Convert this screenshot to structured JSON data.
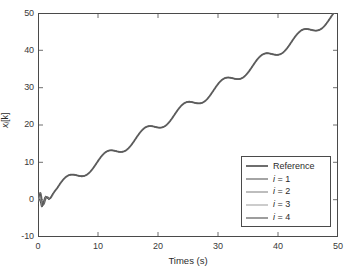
{
  "chart_data": {
    "type": "line",
    "title": "",
    "xlabel": "Times (s)",
    "ylabel": "x_i[k]",
    "ylabel_base": "x",
    "ylabel_sub": "i",
    "ylabel_tail": "[k]",
    "xlim": [
      0,
      50
    ],
    "ylim": [
      -10,
      50
    ],
    "xticks": [
      0,
      10,
      20,
      30,
      40,
      50
    ],
    "yticks": [
      -10,
      0,
      10,
      20,
      30,
      40,
      50
    ],
    "xtick_labels": [
      "0",
      "10",
      "20",
      "30",
      "40",
      "50"
    ],
    "ytick_labels": [
      "-10",
      "0",
      "10",
      "20",
      "30",
      "40",
      "50"
    ],
    "grid": false,
    "legend_position": "lower right",
    "legend_entries": [
      "Reference",
      "i = 1",
      "i = 2",
      "i = 3",
      "i = 4"
    ],
    "series": [
      {
        "name": "Reference",
        "color": "#6e6e6e",
        "width": 1.9,
        "x": [
          0,
          1,
          2,
          3,
          4,
          5,
          6,
          7,
          8,
          9,
          10,
          11,
          12,
          13,
          14,
          15,
          16,
          17,
          18,
          19,
          20,
          21,
          22,
          23,
          24,
          25,
          26,
          27,
          28,
          29,
          30,
          31,
          32,
          33,
          34,
          35,
          36,
          37,
          38,
          39,
          40,
          41,
          42,
          43,
          44,
          45,
          46,
          47,
          48,
          49,
          50
        ],
        "values": [
          0.0,
          1.6,
          2.9,
          3.2,
          3.3,
          3.7,
          4.6,
          6.1,
          7.9,
          9.2,
          9.6,
          9.8,
          10.1,
          10.7,
          11.9,
          13.6,
          15.3,
          16.3,
          16.6,
          16.8,
          17.0,
          17.7,
          19.0,
          20.8,
          22.4,
          23.2,
          23.5,
          23.7,
          24.0,
          24.8,
          26.2,
          28.0,
          29.4,
          30.0,
          30.2,
          30.4,
          30.8,
          31.8,
          33.4,
          35.2,
          36.4,
          36.9,
          37.1,
          37.3,
          37.8,
          38.9,
          40.7,
          42.6,
          43.9,
          44.4,
          44.6
        ]
      },
      {
        "name": "i = 1",
        "color": "#4a4a4a",
        "width": 0.9
      },
      {
        "name": "i = 2",
        "color": "#7d7d7d",
        "width": 0.9
      },
      {
        "name": "i = 3",
        "color": "#9a9a9a",
        "width": 0.9
      },
      {
        "name": "i = 4",
        "color": "#3d3d3d",
        "width": 0.9
      }
    ],
    "annotations": [
      "Initial transient near t = 0 dipping to about -4 and overshooting to about +4",
      "Signal is a ramp of slope ~1 unit/s with a superimposed ripple of period ~6.5 s",
      "All five traces overlap almost exactly after the transient"
    ]
  }
}
